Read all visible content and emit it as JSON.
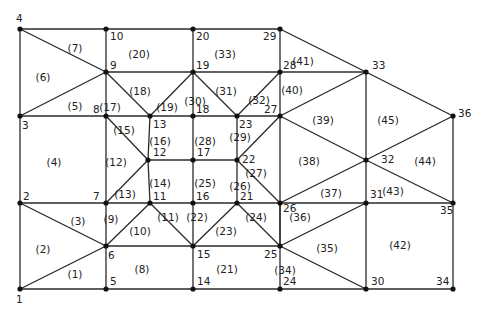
{
  "diagram": {
    "colors": {
      "line": "#2a2a2a",
      "node": "#111111",
      "text": "#222222",
      "background": "#ffffff"
    },
    "nodes": [
      {
        "id": "1",
        "x": 20,
        "y": 289,
        "lx": 16,
        "ly": 303
      },
      {
        "id": "2",
        "x": 20,
        "y": 203,
        "lx": 23,
        "ly": 200
      },
      {
        "id": "3",
        "x": 20,
        "y": 116,
        "lx": 22,
        "ly": 129
      },
      {
        "id": "4",
        "x": 20,
        "y": 29,
        "lx": 16,
        "ly": 22
      },
      {
        "id": "5",
        "x": 106,
        "y": 289,
        "lx": 110,
        "ly": 285
      },
      {
        "id": "6",
        "x": 106,
        "y": 246,
        "lx": 108,
        "ly": 259
      },
      {
        "id": "7",
        "x": 106,
        "y": 203,
        "lx": 93,
        "ly": 200
      },
      {
        "id": "8",
        "x": 106,
        "y": 116,
        "lx": 93,
        "ly": 113
      },
      {
        "id": "9",
        "x": 106,
        "y": 72,
        "lx": 110,
        "ly": 69
      },
      {
        "id": "10",
        "x": 106,
        "y": 29,
        "lx": 110,
        "ly": 40
      },
      {
        "id": "11",
        "x": 150,
        "y": 203,
        "lx": 153,
        "ly": 200
      },
      {
        "id": "12",
        "x": 148,
        "y": 160,
        "lx": 153,
        "ly": 156
      },
      {
        "id": "13",
        "x": 150,
        "y": 116,
        "lx": 153,
        "ly": 128
      },
      {
        "id": "14",
        "x": 193,
        "y": 289,
        "lx": 197,
        "ly": 285
      },
      {
        "id": "15",
        "x": 193,
        "y": 246,
        "lx": 197,
        "ly": 258
      },
      {
        "id": "16",
        "x": 193,
        "y": 203,
        "lx": 196,
        "ly": 200
      },
      {
        "id": "17",
        "x": 193,
        "y": 160,
        "lx": 197,
        "ly": 156
      },
      {
        "id": "18",
        "x": 193,
        "y": 116,
        "lx": 196,
        "ly": 113
      },
      {
        "id": "19",
        "x": 193,
        "y": 72,
        "lx": 196,
        "ly": 69
      },
      {
        "id": "20",
        "x": 193,
        "y": 29,
        "lx": 196,
        "ly": 40
      },
      {
        "id": "21",
        "x": 237,
        "y": 203,
        "lx": 240,
        "ly": 200
      },
      {
        "id": "22",
        "x": 237,
        "y": 160,
        "lx": 242,
        "ly": 163
      },
      {
        "id": "23",
        "x": 237,
        "y": 116,
        "lx": 239,
        "ly": 128
      },
      {
        "id": "24",
        "x": 280,
        "y": 289,
        "lx": 283,
        "ly": 285
      },
      {
        "id": "25",
        "x": 280,
        "y": 246,
        "lx": 264,
        "ly": 258
      },
      {
        "id": "26",
        "x": 280,
        "y": 203,
        "lx": 283,
        "ly": 212
      },
      {
        "id": "27",
        "x": 280,
        "y": 116,
        "lx": 264,
        "ly": 113
      },
      {
        "id": "28",
        "x": 280,
        "y": 72,
        "lx": 283,
        "ly": 69
      },
      {
        "id": "29",
        "x": 280,
        "y": 29,
        "lx": 263,
        "ly": 40
      },
      {
        "id": "30",
        "x": 366,
        "y": 289,
        "lx": 371,
        "ly": 285
      },
      {
        "id": "31",
        "x": 366,
        "y": 203,
        "lx": 370,
        "ly": 198
      },
      {
        "id": "32",
        "x": 366,
        "y": 160,
        "lx": 381,
        "ly": 163
      },
      {
        "id": "33",
        "x": 366,
        "y": 72,
        "lx": 372,
        "ly": 69
      },
      {
        "id": "34",
        "x": 453,
        "y": 289,
        "lx": 436,
        "ly": 285
      },
      {
        "id": "35",
        "x": 453,
        "y": 203,
        "lx": 440,
        "ly": 214
      },
      {
        "id": "36",
        "x": 453,
        "y": 116,
        "lx": 458,
        "ly": 117
      }
    ],
    "edges": [
      [
        "1",
        "2"
      ],
      [
        "2",
        "3"
      ],
      [
        "3",
        "4"
      ],
      [
        "1",
        "5"
      ],
      [
        "5",
        "14"
      ],
      [
        "14",
        "24"
      ],
      [
        "24",
        "30"
      ],
      [
        "30",
        "34"
      ],
      [
        "4",
        "10"
      ],
      [
        "10",
        "20"
      ],
      [
        "20",
        "29"
      ],
      [
        "29",
        "33"
      ],
      [
        "33",
        "36"
      ],
      [
        "36",
        "35"
      ],
      [
        "35",
        "34"
      ],
      [
        "10",
        "9"
      ],
      [
        "9",
        "8"
      ],
      [
        "8",
        "7"
      ],
      [
        "7",
        "6"
      ],
      [
        "6",
        "5"
      ],
      [
        "20",
        "19"
      ],
      [
        "19",
        "18"
      ],
      [
        "18",
        "17"
      ],
      [
        "17",
        "16"
      ],
      [
        "16",
        "15"
      ],
      [
        "15",
        "14"
      ],
      [
        "29",
        "28"
      ],
      [
        "28",
        "27"
      ],
      [
        "27",
        "26"
      ],
      [
        "26",
        "25"
      ],
      [
        "25",
        "24"
      ],
      [
        "33",
        "32"
      ],
      [
        "32",
        "31"
      ],
      [
        "31",
        "30"
      ],
      [
        "13",
        "12"
      ],
      [
        "12",
        "11"
      ],
      [
        "23",
        "22"
      ],
      [
        "22",
        "21"
      ],
      [
        "4",
        "9"
      ],
      [
        "3",
        "9"
      ],
      [
        "3",
        "8"
      ],
      [
        "8",
        "13"
      ],
      [
        "13",
        "18"
      ],
      [
        "18",
        "23"
      ],
      [
        "23",
        "27"
      ],
      [
        "9",
        "19"
      ],
      [
        "19",
        "28"
      ],
      [
        "28",
        "33"
      ],
      [
        "9",
        "13"
      ],
      [
        "13",
        "19"
      ],
      [
        "19",
        "23"
      ],
      [
        "23",
        "28"
      ],
      [
        "8",
        "12"
      ],
      [
        "12",
        "7"
      ],
      [
        "12",
        "17"
      ],
      [
        "17",
        "22"
      ],
      [
        "2",
        "7"
      ],
      [
        "7",
        "11"
      ],
      [
        "11",
        "16"
      ],
      [
        "16",
        "21"
      ],
      [
        "21",
        "26"
      ],
      [
        "26",
        "31"
      ],
      [
        "31",
        "35"
      ],
      [
        "2",
        "6"
      ],
      [
        "1",
        "6"
      ],
      [
        "6",
        "11"
      ],
      [
        "6",
        "15"
      ],
      [
        "11",
        "15"
      ],
      [
        "15",
        "21"
      ],
      [
        "15",
        "25"
      ],
      [
        "21",
        "25"
      ],
      [
        "22",
        "27"
      ],
      [
        "22",
        "26"
      ],
      [
        "25",
        "26"
      ],
      [
        "27",
        "33"
      ],
      [
        "27",
        "32"
      ],
      [
        "26",
        "32"
      ],
      [
        "25",
        "31"
      ],
      [
        "25",
        "30"
      ],
      [
        "32",
        "36"
      ],
      [
        "32",
        "35"
      ]
    ],
    "elements": [
      {
        "id": "(1)",
        "x": 75,
        "y": 275
      },
      {
        "id": "(2)",
        "x": 43,
        "y": 250
      },
      {
        "id": "(3)",
        "x": 78,
        "y": 222
      },
      {
        "id": "(4)",
        "x": 54,
        "y": 163
      },
      {
        "id": "(5)",
        "x": 75,
        "y": 107
      },
      {
        "id": "(6)",
        "x": 43,
        "y": 78
      },
      {
        "id": "(7)",
        "x": 75,
        "y": 49
      },
      {
        "id": "(8)",
        "x": 142,
        "y": 270
      },
      {
        "id": "(9)",
        "x": 111,
        "y": 220
      },
      {
        "id": "(10)",
        "x": 140,
        "y": 232
      },
      {
        "id": "(11)",
        "x": 168,
        "y": 218
      },
      {
        "id": "(12)",
        "x": 116,
        "y": 163
      },
      {
        "id": "(13)",
        "x": 125,
        "y": 195
      },
      {
        "id": "(14)",
        "x": 160,
        "y": 184
      },
      {
        "id": "(15)",
        "x": 124,
        "y": 131
      },
      {
        "id": "(16)",
        "x": 160,
        "y": 142
      },
      {
        "id": "(17)",
        "x": 110,
        "y": 108
      },
      {
        "id": "(18)",
        "x": 140,
        "y": 92
      },
      {
        "id": "(19)",
        "x": 167,
        "y": 108
      },
      {
        "id": "(20)",
        "x": 139,
        "y": 55
      },
      {
        "id": "(21)",
        "x": 227,
        "y": 270
      },
      {
        "id": "(22)",
        "x": 197,
        "y": 218
      },
      {
        "id": "(23)",
        "x": 226,
        "y": 232
      },
      {
        "id": "(24)",
        "x": 256,
        "y": 218
      },
      {
        "id": "(25)",
        "x": 205,
        "y": 184
      },
      {
        "id": "(26)",
        "x": 240,
        "y": 187
      },
      {
        "id": "(27)",
        "x": 256,
        "y": 174
      },
      {
        "id": "(28)",
        "x": 205,
        "y": 142
      },
      {
        "id": "(29)",
        "x": 240,
        "y": 138
      },
      {
        "id": "(30)",
        "x": 195,
        "y": 102
      },
      {
        "id": "(31)",
        "x": 226,
        "y": 92
      },
      {
        "id": "(32)",
        "x": 259,
        "y": 101
      },
      {
        "id": "(33)",
        "x": 225,
        "y": 55
      },
      {
        "id": "(34)",
        "x": 285,
        "y": 271
      },
      {
        "id": "(35)",
        "x": 327,
        "y": 249
      },
      {
        "id": "(36)",
        "x": 300,
        "y": 218
      },
      {
        "id": "(37)",
        "x": 331,
        "y": 194
      },
      {
        "id": "(38)",
        "x": 309,
        "y": 162
      },
      {
        "id": "(39)",
        "x": 323,
        "y": 121
      },
      {
        "id": "(40)",
        "x": 292,
        "y": 91
      },
      {
        "id": "(41)",
        "x": 303,
        "y": 62
      },
      {
        "id": "(42)",
        "x": 400,
        "y": 246
      },
      {
        "id": "(43)",
        "x": 393,
        "y": 192
      },
      {
        "id": "(44)",
        "x": 425,
        "y": 162
      },
      {
        "id": "(45)",
        "x": 388,
        "y": 121
      }
    ]
  }
}
